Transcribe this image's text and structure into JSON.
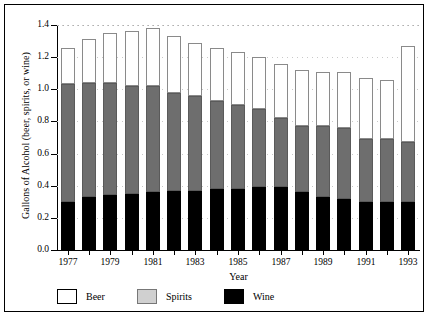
{
  "chart_data": {
    "type": "bar",
    "subtype": "stacked-bar",
    "title": "",
    "xlabel": "Year",
    "ylabel": "Gallons of Alcohol (beer, spirits, or wine)",
    "ylim": [
      0.0,
      1.4
    ],
    "yticks": [
      "0.0",
      "0.2",
      "0.4",
      "0.6",
      "0.8",
      "1.0",
      "1.2",
      "1.4"
    ],
    "ytick_values": [
      0.0,
      0.2,
      0.4,
      0.6,
      0.8,
      1.0,
      1.2,
      1.4
    ],
    "grid": "dotted-horizontal",
    "legend_position": "below-axes",
    "categories": [
      1977,
      1978,
      1979,
      1980,
      1981,
      1982,
      1983,
      1984,
      1985,
      1986,
      1987,
      1988,
      1989,
      1990,
      1991,
      1992,
      1993
    ],
    "xtick_labels": [
      "1977",
      "1979",
      "1981",
      "1983",
      "1985",
      "1987",
      "1989",
      "1991",
      "1993"
    ],
    "xtick_values": [
      1977,
      1979,
      1981,
      1983,
      1985,
      1987,
      1989,
      1991,
      1993
    ],
    "series": [
      {
        "name": "Wine",
        "color": "#000000",
        "stack_order": 1,
        "values": [
          0.3,
          0.33,
          0.34,
          0.35,
          0.36,
          0.37,
          0.37,
          0.38,
          0.38,
          0.39,
          0.39,
          0.36,
          0.33,
          0.32,
          0.3,
          0.3,
          0.3
        ]
      },
      {
        "name": "Spirits",
        "color": "#6e6e6e",
        "stack_order": 2,
        "values": [
          0.73,
          0.71,
          0.7,
          0.67,
          0.66,
          0.61,
          0.59,
          0.55,
          0.52,
          0.49,
          0.43,
          0.41,
          0.44,
          0.44,
          0.39,
          0.39,
          0.37
        ]
      },
      {
        "name": "Beer",
        "color": "#ffffff",
        "stack_order": 3,
        "values": [
          0.23,
          0.27,
          0.31,
          0.34,
          0.36,
          0.35,
          0.33,
          0.33,
          0.33,
          0.32,
          0.34,
          0.35,
          0.34,
          0.35,
          0.38,
          0.37,
          0.6
        ]
      }
    ],
    "cumulative_spirits_top": [
      1.03,
      1.04,
      1.04,
      1.02,
      1.02,
      0.98,
      0.96,
      0.93,
      0.9,
      0.88,
      0.82,
      0.77,
      0.77,
      0.76,
      0.69,
      0.69,
      0.67
    ],
    "totals": [
      1.26,
      1.31,
      1.35,
      1.36,
      1.38,
      1.33,
      1.29,
      1.26,
      1.23,
      1.2,
      1.16,
      1.12,
      1.11,
      1.11,
      1.07,
      1.06,
      1.27
    ]
  },
  "legend": {
    "items": [
      {
        "label": "Beer",
        "swatch": "beer-swatch"
      },
      {
        "label": "Spirits",
        "swatch": "spirits-swatch"
      },
      {
        "label": "Wine",
        "swatch": "wine-swatch"
      }
    ]
  }
}
